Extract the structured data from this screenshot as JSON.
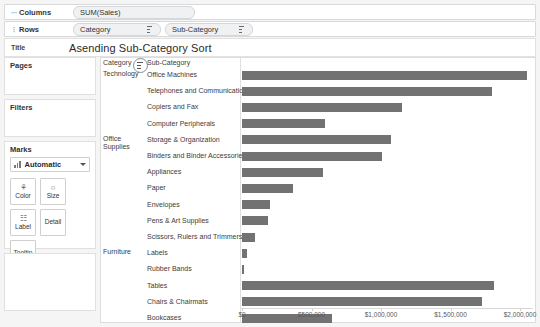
{
  "shelves": {
    "columns": {
      "label": "Columns",
      "pills": [
        {
          "text": "SUM(Sales)",
          "sort": false
        }
      ]
    },
    "rows": {
      "label": "Rows",
      "pills": [
        {
          "text": "Category",
          "sort": true
        },
        {
          "text": "Sub-Category",
          "sort": true
        }
      ]
    }
  },
  "title": {
    "key": "Title",
    "value": "Asending Sub-Category Sort"
  },
  "sidebar": {
    "pages": {
      "header": "Pages"
    },
    "filters": {
      "header": "Filters"
    },
    "marks": {
      "header": "Marks",
      "mark_type": "Automatic",
      "buttons": [
        {
          "label": "Color",
          "icon": "palette-icon",
          "glyph": "⚘"
        },
        {
          "label": "Size",
          "icon": "size-circle-icon",
          "glyph": "○"
        },
        {
          "label": "Label",
          "icon": "label-tag-icon",
          "glyph": "☷"
        },
        {
          "label": "Detail",
          "icon": "detail-icon",
          "glyph": ""
        },
        {
          "label": "Tooltip",
          "icon": "tooltip-icon",
          "glyph": ""
        }
      ]
    }
  },
  "view": {
    "header_category": "Category",
    "header_subcategory": "Sub-Category",
    "sort_badge_icon": "sort-ascending-icon"
  },
  "chart_data": {
    "type": "bar",
    "title": "Asending Sub-Category Sort",
    "orientation": "horizontal",
    "xlabel": "",
    "ylabel": "",
    "xlim": [
      0,
      2000000
    ],
    "grid": false,
    "legend": false,
    "tick_labels": [
      "$0",
      "$500,000",
      "$1,000,000",
      "$1,500,000",
      "$2,000,000"
    ],
    "tick_values": [
      0,
      500000,
      1000000,
      1500000,
      2000000
    ],
    "bar_color": "#727272",
    "groups": [
      {
        "name": "Technology",
        "rows": 4
      },
      {
        "name": "Office Supplies",
        "rows": 7
      },
      {
        "name": "Furniture",
        "rows": 4
      }
    ],
    "categories": [
      "Office Machines",
      "Telephones and Communication",
      "Copiers and Fax",
      "Computer Peripherals",
      "Storage & Organization",
      "Binders and Binder Accessories",
      "Appliances",
      "Paper",
      "Envelopes",
      "Pens & Art Supplies",
      "Scissors, Rulers and Trimmers",
      "Labels",
      "Rubber Bands",
      "Tables",
      "Chairs & Chairmats",
      "Bookcases",
      "Office Furnishings"
    ],
    "values": [
      2050000,
      1800000,
      1150000,
      600000,
      1070000,
      1010000,
      580000,
      365000,
      200000,
      190000,
      90000,
      35000,
      15000,
      1810000,
      1730000,
      650000,
      535000
    ]
  }
}
